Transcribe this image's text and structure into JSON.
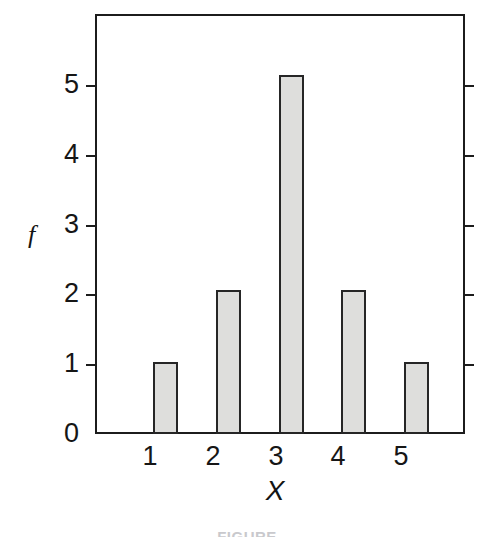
{
  "chart_data": {
    "type": "bar",
    "title": "",
    "xlabel": "X",
    "ylabel": "f",
    "categories": [
      "1",
      "2",
      "3",
      "4",
      "5"
    ],
    "values": [
      1,
      2,
      5,
      2,
      1
    ],
    "ylim": [
      0,
      5.85
    ],
    "yticks": [
      0,
      1,
      2,
      3,
      4,
      5
    ],
    "ytick_labels": [
      "0",
      "1",
      "2",
      "3",
      "4",
      "5"
    ],
    "xtick_labels": [
      "1",
      "2",
      "3",
      "4",
      "5"
    ],
    "grid": false,
    "legend": null,
    "bar_fill_color": "#dededc",
    "bar_edge_color": "#262626",
    "axis_color": "#1c1c1c",
    "background_color": "#ffffff",
    "right_axis_ticks": [
      1,
      2,
      3,
      4,
      5
    ]
  },
  "caption": {
    "text": "FIGURE"
  }
}
